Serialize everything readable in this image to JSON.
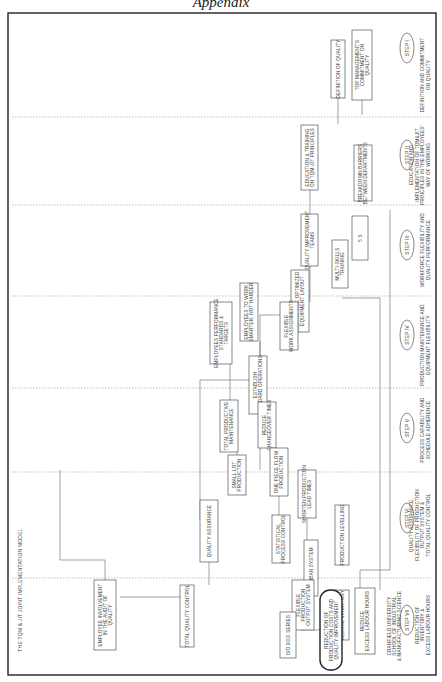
{
  "page_heading": "Appendix",
  "caption": "THE TQM & JIT JOINT IMPLEMENTATION MODEL",
  "source_note": [
    "CRANFIELD UNIVERSITY",
    "SCHOOL OF INDUSTRIAL",
    "& MANUFACTURING SCIENCE"
  ],
  "steps": [
    {
      "label": "STEP I",
      "description": [
        "DEFINITION AND COMMITMENT",
        "ON QUALITY"
      ]
    },
    {
      "label": "STEP II",
      "description": [
        "EDUCATION AND",
        "IMPLEMENTATION OF TQM&JIT",
        "PRINCIPLES IN THE EMPLOYEES'",
        "WAY OF WORKING"
      ]
    },
    {
      "label": "STEP III",
      "description": [
        "WORKFORCE FLEXIBILITY AND",
        "QUALITY PERFORMANCE"
      ]
    },
    {
      "label": "STEP IV",
      "description": [
        "PRODUCTION MAINTENANCE AND",
        "EQUIPMENT FLEXIBILITY"
      ]
    },
    {
      "label": "STEP V",
      "description": [
        "PROCESS CAPABILITY AND",
        "SCHEDULE ADHERENCE"
      ]
    },
    {
      "label": "STEP VI",
      "description": [
        "QUALITY ASSURANCE,",
        "FLEXIBILITY OF PRODUCTION",
        "OUTPUT SYSTEM &",
        "TOTAL QUALITY CONTROL"
      ]
    },
    {
      "label": "STEP VII",
      "description": [
        "REDUCTION OF",
        "INVENTORY &",
        "EXCESS LABOUR HOURS"
      ]
    }
  ],
  "boxes": {
    "top_management": [
      "TOP MANAGEMENT'S",
      "COMMITMENT ON",
      "QUALITY"
    ],
    "definition_quality": [
      "DEFINITION OF QUALITY"
    ],
    "education_training": [
      "EDUCATION & TRAINING",
      "ON TQM-JIT PRINCIPLES"
    ],
    "quality_teams": [
      "QUALITY IMPROVEMENT",
      "TEAMS"
    ],
    "employees_work_smarter": [
      "EMPLOYEES TO WORK",
      "SMARTER, NOT HARDER"
    ],
    "employees_performance": [
      "EMPLOYEES PERFORMANCE",
      "STANDARDS &",
      "TARGETS"
    ],
    "employee_involvement": [
      "EMPLOYEE INVOLVEMENT",
      "IN THE AUDIT OF",
      "QUALITY"
    ],
    "multiskills": [
      "MULTI-SKILLS",
      "TRAINING"
    ],
    "five_s": [
      "5 S"
    ],
    "breakdown_barriers": [
      "BREAKDOWN BARRIERS",
      "BETWEEN DEPARTMENTS"
    ],
    "rearrange_layout": [
      "REARRANGE OPTIMIZED",
      "EQUIPMENT LAYOUT"
    ],
    "flexible_work": [
      "FLEXIBLE",
      "WORK ASSIGNMENTS"
    ],
    "standard_operations": [
      "ESTABLISH",
      "STANDARD OPERATIONS"
    ],
    "tpm": [
      "TOTAL PRODUCTIVE",
      "MAINTENANCE"
    ],
    "reduce_changeover": [
      "REDUCE",
      "CHANGEOVER TIMES"
    ],
    "one_piece_flow": [
      "ONE PIECE FLOW",
      "PRODUCTION"
    ],
    "small_lot": [
      "SMALL LOT",
      "PRODUCTION"
    ],
    "shorten_lead": [
      "SHORTEN PRODUCTION",
      "LEAD TIMES"
    ],
    "spc": [
      "STATISTICAL",
      "PROCESS CONTROL"
    ],
    "production_levelling": [
      "PRODUCTION LEVELLING"
    ],
    "quality_assurance": [
      "QUALITY ASSURANCE"
    ],
    "kanban": [
      "KANBAN SYSTEM"
    ],
    "flexible_output": [
      "FLEXIBLE",
      "PRODUCTION",
      "OUTPUT SYSTEM"
    ],
    "iso9000": [
      "ISO 9000 SERIES"
    ],
    "tqc": [
      "TOTAL QUALITY CONTROL"
    ],
    "reduce_inventory": [
      "REDUCE INVENTORY"
    ],
    "reduce_labour": [
      "REDUCE",
      "EXCESS LABOUR HOURS"
    ],
    "final_goal": [
      "REDUCTION OF",
      "PRODUCTION COSTS AND",
      "QUALITY IMPROVEMENT"
    ]
  }
}
